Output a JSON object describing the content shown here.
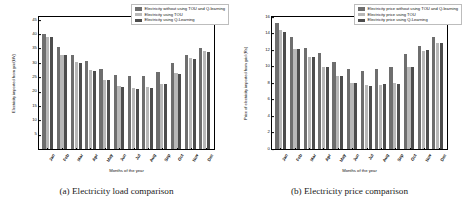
{
  "figure": {
    "panels": [
      {
        "id": "load",
        "caption": "(a) Electricity load comparison",
        "chart_data": {
          "type": "bar",
          "title": "",
          "xlabel": "Months of the year",
          "ylabel": "Electricity imported from grid(kW)",
          "categories": [
            "Jan",
            "Feb",
            "Mar",
            "Apr",
            "May",
            "Jun",
            "Jul",
            "Aug",
            "Sep",
            "Oct",
            "Nov",
            "Dec"
          ],
          "ylim": [
            0,
            46
          ],
          "yticks": [
            5,
            10,
            15,
            20,
            25,
            30,
            35,
            40,
            45
          ],
          "grid": false,
          "legend_position": "upper right",
          "series": [
            {
              "name": "Electricity without using TOU and Q-learning",
              "color": "#6e6e6e",
              "values": [
                40.2,
                35.6,
                32.6,
                30.5,
                28.0,
                25.8,
                25.3,
                25.6,
                26.7,
                29.9,
                32.9,
                35.2
              ]
            },
            {
              "name": "Electricity using TOU",
              "color": "#b8b8b8",
              "values": [
                39.2,
                32.9,
                30.2,
                27.4,
                24.2,
                22.0,
                21.2,
                21.7,
                22.8,
                26.5,
                31.6,
                34.1
              ]
            },
            {
              "name": "Electricity using Q-Learning",
              "color": "#4d4d4d",
              "values": [
                38.9,
                32.6,
                29.9,
                27.1,
                23.9,
                21.7,
                20.9,
                21.4,
                22.5,
                26.2,
                31.3,
                33.8
              ]
            }
          ]
        }
      },
      {
        "id": "price",
        "caption": "(b) Electricity price comparison",
        "chart_data": {
          "type": "bar",
          "title": "",
          "xlabel": "Months of the year",
          "ylabel": "Price of electricity imported from grid (Rs)",
          "categories": [
            "Jan",
            "Feb",
            "Mar",
            "Apr",
            "May",
            "Jun",
            "Jul",
            "Aug",
            "Sep",
            "Oct",
            "Nov",
            "Dec"
          ],
          "ylim": [
            0,
            16
          ],
          "yticks": [
            0,
            2,
            4,
            6,
            8,
            10,
            12,
            14,
            16
          ],
          "grid": false,
          "legend_position": "upper right",
          "series": [
            {
              "name": "Electricity price without using TOU and Q-learning",
              "color": "#6e6e6e",
              "values": [
                15.3,
                13.6,
                12.3,
                11.6,
                10.6,
                9.7,
                9.4,
                9.7,
                10.0,
                11.5,
                12.5,
                13.6
              ]
            },
            {
              "name": "Electricity price using TOU",
              "color": "#b8b8b8",
              "values": [
                14.4,
                12.1,
                11.1,
                10.0,
                8.8,
                8.0,
                7.7,
                7.8,
                8.0,
                9.9,
                11.9,
                12.9
              ]
            },
            {
              "name": "Electricity price using Q-Learning",
              "color": "#4d4d4d",
              "values": [
                14.2,
                12.1,
                11.1,
                10.0,
                8.9,
                8.0,
                7.6,
                7.9,
                7.9,
                10.0,
                12.0,
                12.8
              ]
            }
          ]
        }
      }
    ]
  }
}
